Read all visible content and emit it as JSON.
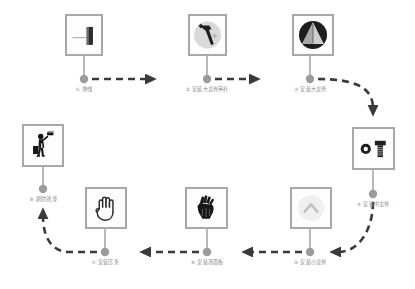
{
  "diagram": {
    "background_color": "#ffffff",
    "connector_color": "#3a3a3a",
    "node_dot_color": "#9b9b9b",
    "box_border_color": "#a8a8a8",
    "label_color": "#8d8d8d",
    "flow_type": "serpentine-process",
    "nodes": [
      {
        "id": "step1",
        "number": "①",
        "label": "① 弹线",
        "icon": "chalk-line-marker-icon",
        "box": {
          "x": 65,
          "y": 14,
          "w": 38,
          "h": 42
        },
        "dot": {
          "x": 84,
          "y": 79
        },
        "label_pos": {
          "x": 84,
          "y": 88
        }
      },
      {
        "id": "step2",
        "number": "②",
        "label": "② 安装大龙骨吊杆",
        "icon": "hammer-icon",
        "box": {
          "x": 188,
          "y": 14,
          "w": 39,
          "h": 42
        },
        "dot": {
          "x": 207,
          "y": 79
        },
        "label_pos": {
          "x": 207,
          "y": 88
        }
      },
      {
        "id": "step3",
        "number": "③",
        "label": "③ 安装大龙骨",
        "icon": "trowel-circle-icon",
        "box": {
          "x": 292,
          "y": 14,
          "w": 42,
          "h": 42
        },
        "dot": {
          "x": 310,
          "y": 79
        },
        "label_pos": {
          "x": 310,
          "y": 88
        }
      },
      {
        "id": "step4",
        "number": "④",
        "label": "④ 安装中龙骨",
        "icon": "bolt-and-nut-icon",
        "box": {
          "x": 352,
          "y": 127,
          "w": 43,
          "h": 43
        },
        "dot": {
          "x": 373,
          "y": 194
        },
        "label_pos": {
          "x": 373,
          "y": 203
        }
      },
      {
        "id": "step5",
        "number": "⑤",
        "label": "⑤ 安装小龙骨",
        "icon": "angle-bracket-circle-icon",
        "box": {
          "x": 290,
          "y": 187,
          "w": 42,
          "h": 42
        },
        "dot": {
          "x": 310,
          "y": 252
        },
        "label_pos": {
          "x": 310,
          "y": 261
        }
      },
      {
        "id": "step6",
        "number": "⑥",
        "label": "⑥ 安装罩面板",
        "icon": "work-glove-icon",
        "box": {
          "x": 185,
          "y": 187,
          "w": 43,
          "h": 42
        },
        "dot": {
          "x": 207,
          "y": 252
        },
        "label_pos": {
          "x": 207,
          "y": 261
        }
      },
      {
        "id": "step7",
        "number": "⑦",
        "label": "⑦ 安装压条",
        "icon": "open-hand-icon",
        "box": {
          "x": 85,
          "y": 187,
          "w": 42,
          "h": 42
        },
        "dot": {
          "x": 105,
          "y": 252
        },
        "label_pos": {
          "x": 105,
          "y": 261
        }
      },
      {
        "id": "step8",
        "number": "⑧",
        "label": "⑧ 刷防锈漆",
        "icon": "painter-roller-icon",
        "box": {
          "x": 22,
          "y": 124,
          "w": 42,
          "h": 43
        },
        "dot": {
          "x": 43,
          "y": 189
        },
        "label_pos": {
          "x": 43,
          "y": 199
        }
      }
    ],
    "connectors": [
      {
        "from": "step1",
        "to": "step2",
        "style": "dashed-arrow",
        "direction": "right"
      },
      {
        "from": "step2",
        "to": "step3",
        "style": "dashed-arrow",
        "direction": "right"
      },
      {
        "from": "step3",
        "to": "step4",
        "style": "dashed-arrow",
        "direction": "curve-down-right"
      },
      {
        "from": "step4",
        "to": "step5",
        "style": "dashed-arrow",
        "direction": "curve-down-left"
      },
      {
        "from": "step5",
        "to": "step6",
        "style": "dashed-arrow",
        "direction": "left"
      },
      {
        "from": "step6",
        "to": "step7",
        "style": "dashed-arrow",
        "direction": "left"
      },
      {
        "from": "step7",
        "to": "step8",
        "style": "dashed-arrow",
        "direction": "curve-up-left"
      }
    ]
  }
}
